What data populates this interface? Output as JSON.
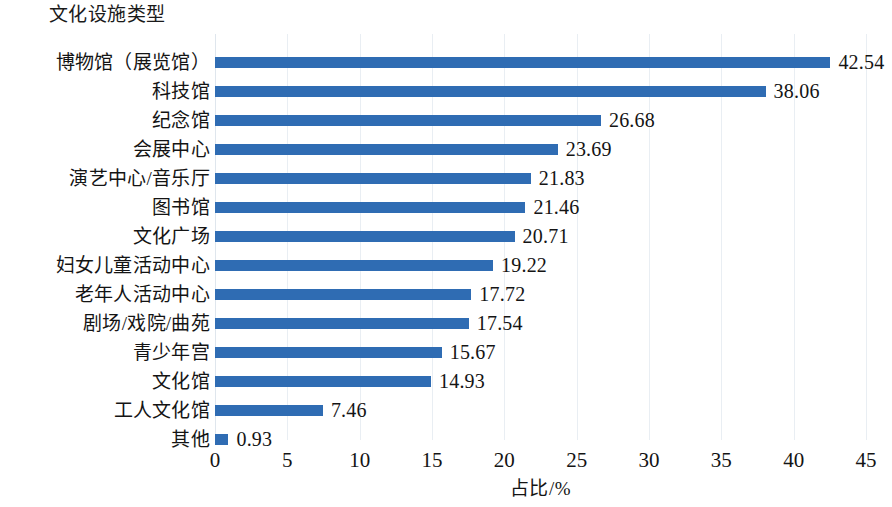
{
  "chart": {
    "category_axis_title": "文化设施类型",
    "x_axis_title": "占比/%"
  },
  "chart_data": {
    "type": "bar",
    "orientation": "horizontal",
    "title": "",
    "xlabel": "占比/%",
    "ylabel": "文化设施类型",
    "xlim": [
      0,
      45
    ],
    "xticks": [
      "0",
      "5",
      "10",
      "15",
      "20",
      "25",
      "30",
      "35",
      "40",
      "45"
    ],
    "xtick_step": 5,
    "grid": true,
    "grid_axis": "x",
    "legend": false,
    "bar_color": "#2f6cb3",
    "value_label_color": "#141414",
    "background": "#ffffff",
    "categories": [
      "博物馆（展览馆）",
      "科技馆",
      "纪念馆",
      "会展中心",
      "演艺中心/音乐厅",
      "图书馆",
      "文化广场",
      "妇女儿童活动中心",
      "老年人活动中心",
      "剧场/戏院/曲苑",
      "青少年宫",
      "文化馆",
      "工人文化馆",
      "其他"
    ],
    "values": [
      42.54,
      38.06,
      26.68,
      23.69,
      21.83,
      21.46,
      20.71,
      19.22,
      17.72,
      17.54,
      15.67,
      14.93,
      7.46,
      0.93
    ],
    "value_labels": [
      "42.54",
      "38.06",
      "26.68",
      "23.69",
      "21.83",
      "21.46",
      "20.71",
      "19.22",
      "17.72",
      "17.54",
      "15.67",
      "14.93",
      "7.46",
      "0.93"
    ]
  }
}
